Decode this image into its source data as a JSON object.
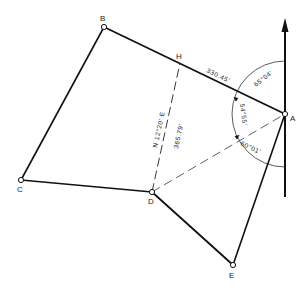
{
  "diagram": {
    "type": "survey traverse",
    "points": {
      "A": {
        "label": "A"
      },
      "B": {
        "label": "B"
      },
      "C": {
        "label": "C"
      },
      "D": {
        "label": "D"
      },
      "E": {
        "label": "E"
      },
      "H": {
        "label": "H"
      }
    },
    "annotations": {
      "distance_AH": "330.45'",
      "bearing_DH": "N 12°20' E",
      "distance_DH": "365.79'",
      "angle_north_AB": "65°04'",
      "angle_AB_AD": "54°55'",
      "angle_AD_AE": "60°01'"
    },
    "north_arrow": "north-arrow"
  }
}
